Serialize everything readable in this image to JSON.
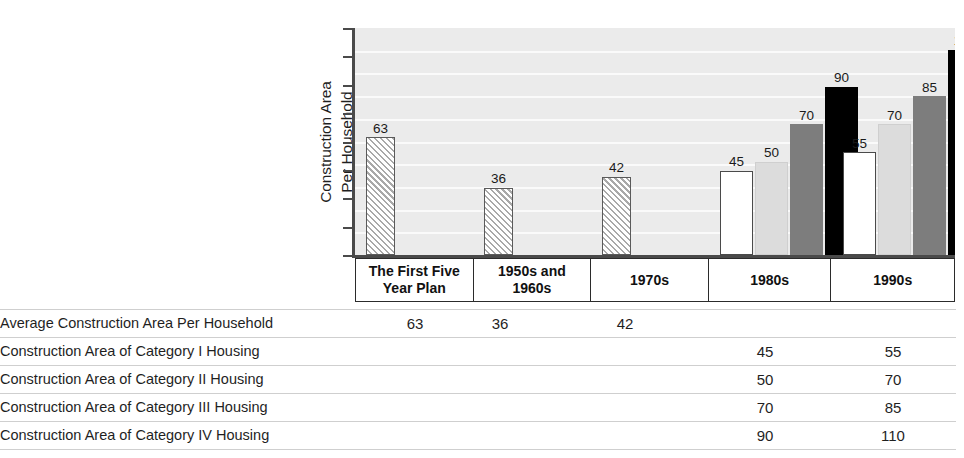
{
  "chart_data": {
    "type": "bar",
    "title": "",
    "xlabel": "",
    "ylabel": "Construction Area Per Household (square meters)",
    "ylim": [
      0,
      120
    ],
    "grid": true,
    "legend_position": "none",
    "categories": [
      "The First Five Year Plan",
      "1950s and 1960s",
      "1970s",
      "1980s",
      "1990s"
    ],
    "series": [
      {
        "name": "Average Construction Area Per Household",
        "style": "hatched",
        "values": [
          63,
          36,
          42,
          null,
          null
        ]
      },
      {
        "name": "Construction Area of Category I Housing",
        "style": "white",
        "values": [
          null,
          null,
          null,
          45,
          55
        ]
      },
      {
        "name": "Construction Area of Category II Housing",
        "style": "light-gray",
        "values": [
          null,
          null,
          null,
          50,
          70
        ]
      },
      {
        "name": "Construction Area of Category III Housing",
        "style": "dark-gray",
        "values": [
          null,
          null,
          null,
          70,
          85
        ]
      },
      {
        "name": "Construction Area of Category IV Housing",
        "style": "black",
        "values": [
          null,
          null,
          null,
          90,
          110
        ]
      }
    ],
    "bar_labels": {
      "group_0": [
        "63"
      ],
      "group_1": [
        "36"
      ],
      "group_2": [
        "42"
      ],
      "group_3": [
        "45",
        "50",
        "70",
        "90"
      ],
      "group_4": [
        "55",
        "70",
        "85",
        "110"
      ]
    }
  },
  "axis": {
    "y_title_line1": "Construction Area",
    "y_title_line2": "Per Household",
    "y_title_line3": "(square meters)",
    "tick_count": 9
  },
  "x_labels": [
    {
      "line1": "The First Five",
      "line2": "Year Plan"
    },
    {
      "line1": "1950s and",
      "line2": "1960s"
    },
    {
      "line1": "1970s",
      "line2": ""
    },
    {
      "line1": "1980s",
      "line2": ""
    },
    {
      "line1": "1990s",
      "line2": ""
    }
  ],
  "bars": {
    "g0": [
      {
        "v": "63",
        "cls": "hatch"
      }
    ],
    "g1": [
      {
        "v": "36",
        "cls": "hatch"
      }
    ],
    "g2": [
      {
        "v": "42",
        "cls": "hatch"
      }
    ],
    "g3": [
      {
        "v": "45",
        "cls": "cat1"
      },
      {
        "v": "50",
        "cls": "cat2"
      },
      {
        "v": "70",
        "cls": "cat3"
      },
      {
        "v": "90",
        "cls": "cat4"
      }
    ],
    "g4": [
      {
        "v": "55",
        "cls": "cat1"
      },
      {
        "v": "70",
        "cls": "cat2"
      },
      {
        "v": "85",
        "cls": "cat3"
      },
      {
        "v": "110",
        "cls": "cat4"
      }
    ]
  },
  "table": {
    "rows": [
      {
        "label": "Average Construction Area Per Household",
        "c1": "63",
        "c2": "36",
        "c3": "42",
        "c4": "",
        "c5": ""
      },
      {
        "label": "Construction Area of Category I Housing",
        "c1": "",
        "c2": "",
        "c3": "",
        "c4": "45",
        "c5": "55"
      },
      {
        "label": "Construction Area of Category II Housing",
        "c1": "",
        "c2": "",
        "c3": "",
        "c4": "50",
        "c5": "70"
      },
      {
        "label": "Construction Area of Category III Housing",
        "c1": "",
        "c2": "",
        "c3": "",
        "c4": "70",
        "c5": "85"
      },
      {
        "label": "Construction Area of Category IV Housing",
        "c1": "",
        "c2": "",
        "c3": "",
        "c4": "90",
        "c5": "110"
      }
    ]
  },
  "colors": {
    "plot_background": "#ebebeb",
    "gridline": "#fafafa",
    "axis": "#4a4a4a",
    "category_1": "#ffffff",
    "category_2": "#dcdcdc",
    "category_3": "#7d7d7d",
    "category_4": "#000000",
    "hatch": "#a9a9a9"
  }
}
